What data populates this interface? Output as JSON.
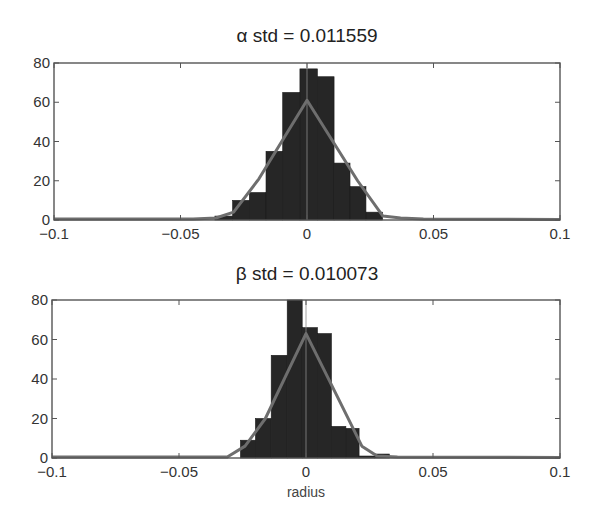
{
  "chart_data": [
    {
      "type": "bar",
      "subtype": "histogram_with_fit",
      "title": "α std = 0.011559",
      "xlabel": "",
      "ylabel": "",
      "xlim": [
        -0.1,
        0.1
      ],
      "ylim": [
        0,
        80
      ],
      "xticks": [
        -0.1,
        -0.05,
        0,
        0.05,
        0.1
      ],
      "xtick_labels": [
        "-0.1",
        "-0.05",
        "0",
        "0.05",
        "0.1"
      ],
      "yticks": [
        0,
        20,
        40,
        60,
        80
      ],
      "ytick_labels": [
        "0",
        "20",
        "40",
        "60",
        "80"
      ],
      "grid": false,
      "bin_edges": [
        -0.0364,
        -0.0294,
        -0.0228,
        -0.0162,
        -0.0096,
        -0.0028,
        0.0041,
        0.0107,
        0.017,
        0.0233,
        0.0299
      ],
      "values": [
        2,
        10,
        14,
        35,
        65,
        77,
        73,
        29,
        17,
        4
      ],
      "fit_curve": {
        "label": "gaussian fit",
        "x": [
          -0.1,
          -0.045,
          -0.036,
          -0.029,
          -0.019,
          0.0,
          0.02,
          0.03,
          0.037,
          0.046,
          0.1
        ],
        "y": [
          0.5,
          0.5,
          1,
          4,
          21,
          61,
          20,
          2,
          1,
          0.5,
          0.3
        ]
      },
      "colors": {
        "bars": "#262626",
        "fit": "#6e6e6e",
        "frame": "#555555"
      }
    },
    {
      "type": "bar",
      "subtype": "histogram_with_fit",
      "title": "β std = 0.010073",
      "xlabel": "radius",
      "ylabel": "",
      "xlim": [
        -0.1,
        0.1
      ],
      "ylim": [
        0,
        80
      ],
      "xticks": [
        -0.1,
        -0.05,
        0,
        0.05,
        0.1
      ],
      "xtick_labels": [
        "-0.1",
        "-0.05",
        "0",
        "0.05",
        "0.1"
      ],
      "yticks": [
        0,
        20,
        40,
        60,
        80
      ],
      "ytick_labels": [
        "0",
        "20",
        "40",
        "60",
        "80"
      ],
      "grid": false,
      "bin_edges": [
        -0.0258,
        -0.0199,
        -0.0137,
        -0.0074,
        -0.0015,
        0.0045,
        0.01,
        0.0157,
        0.0209,
        0.0269,
        0.0328
      ],
      "values": [
        9,
        20,
        52,
        80,
        66,
        63,
        16,
        15,
        1,
        2
      ],
      "fit_curve": {
        "label": "gaussian fit",
        "x": [
          -0.1,
          -0.035,
          -0.031,
          -0.024,
          -0.016,
          0.0,
          0.012,
          0.022,
          0.028,
          0.036,
          0.1
        ],
        "y": [
          0.5,
          0.5,
          0.5,
          6,
          20,
          63,
          32,
          6,
          1,
          0.5,
          0.3
        ]
      },
      "colors": {
        "bars": "#262626",
        "fit": "#6e6e6e",
        "frame": "#555555"
      }
    }
  ]
}
